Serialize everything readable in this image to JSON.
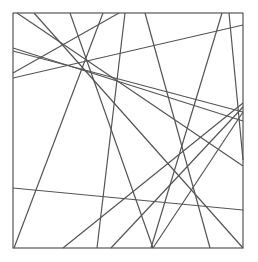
{
  "figure": {
    "width": 258,
    "height": 262,
    "background": "#ffffff",
    "stroke": "#555555",
    "stroke_width": 1.2,
    "frame": {
      "x": 13,
      "y": 13,
      "width": 230,
      "height": 235
    },
    "lines": [
      {
        "x1": 17,
        "y1": 13,
        "x2": 243,
        "y2": 166
      },
      {
        "x1": 34,
        "y1": 13,
        "x2": 243,
        "y2": 248
      },
      {
        "x1": 70,
        "y1": 13,
        "x2": 153,
        "y2": 248
      },
      {
        "x1": 103,
        "y1": 13,
        "x2": 14,
        "y2": 248
      },
      {
        "x1": 119,
        "y1": 13,
        "x2": 13,
        "y2": 73
      },
      {
        "x1": 125,
        "y1": 13,
        "x2": 97,
        "y2": 248
      },
      {
        "x1": 145,
        "y1": 13,
        "x2": 210,
        "y2": 248
      },
      {
        "x1": 222,
        "y1": 13,
        "x2": 151,
        "y2": 248
      },
      {
        "x1": 229,
        "y1": 13,
        "x2": 243,
        "y2": 160
      },
      {
        "x1": 13,
        "y1": 78,
        "x2": 243,
        "y2": 25
      },
      {
        "x1": 13,
        "y1": 48,
        "x2": 243,
        "y2": 121
      },
      {
        "x1": 13,
        "y1": 51,
        "x2": 243,
        "y2": 112
      },
      {
        "x1": 13,
        "y1": 188,
        "x2": 243,
        "y2": 210
      },
      {
        "x1": 63,
        "y1": 248,
        "x2": 243,
        "y2": 103
      },
      {
        "x1": 111,
        "y1": 248,
        "x2": 243,
        "y2": 107
      },
      {
        "x1": 153,
        "y1": 248,
        "x2": 243,
        "y2": 112
      }
    ]
  }
}
